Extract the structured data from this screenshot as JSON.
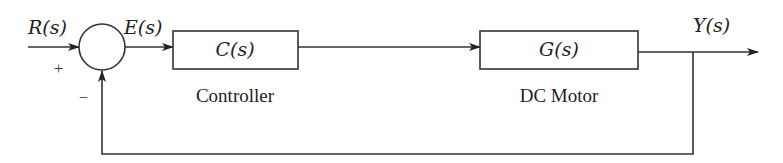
{
  "diagram": {
    "type": "feedback-control-block-diagram",
    "signals": {
      "input": "R(s)",
      "error": "E(s)",
      "output": "Y(s)"
    },
    "summing_junction": {
      "plus_sign": "+",
      "minus_sign": "−"
    },
    "blocks": [
      {
        "id": "controller",
        "transfer_function": "C(s)",
        "caption": "Controller"
      },
      {
        "id": "plant",
        "transfer_function": "G(s)",
        "caption": "DC Motor"
      }
    ],
    "feedback": "unity negative feedback from Y(s) to summing junction",
    "colors": {
      "stroke": "#333333",
      "background": "#ffffff"
    }
  }
}
